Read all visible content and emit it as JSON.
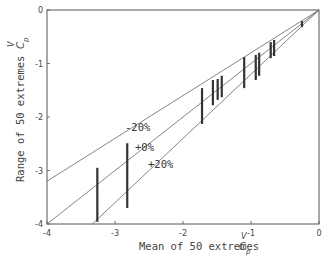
{
  "chart_data": {
    "type": "scatter",
    "title": "",
    "xlabel": "Mean of 50 extremes",
    "xlabel_symbol": {
      "main": "C",
      "sub": "p",
      "sup": "V"
    },
    "ylabel": "Range of 50 extremes",
    "ylabel_symbol": {
      "main": "C",
      "sub": "p",
      "sup": "V"
    },
    "xlim": [
      -4,
      0
    ],
    "ylim": [
      -4,
      0
    ],
    "xticks": [
      -4,
      -3,
      -2,
      -1,
      0
    ],
    "yticks": [
      0,
      -1,
      -2,
      -3,
      -4
    ],
    "xtick_labels": [
      "-4",
      "-3",
      "-2",
      "-1",
      "0"
    ],
    "ytick_labels": [
      "0",
      "-1",
      "-2",
      "-3",
      "-4"
    ],
    "grid": false,
    "legend": null,
    "reference_lines": [
      {
        "name": "-20%",
        "label": "-20%",
        "slope": 0.8,
        "through": [
          0,
          0
        ]
      },
      {
        "name": "+0%",
        "label": "+0%",
        "slope": 1.0,
        "through": [
          0,
          0
        ]
      },
      {
        "name": "+20%",
        "label": "+20%",
        "slope": 1.2,
        "through": [
          0,
          0
        ]
      }
    ],
    "series": [
      {
        "name": "Range of 50 extremes",
        "kind": "vertical-range-bars",
        "points": [
          {
            "x": -3.26,
            "y_top": -2.95,
            "y_bottom": -3.96
          },
          {
            "x": -2.82,
            "y_top": -2.49,
            "y_bottom": -3.7
          },
          {
            "x": -1.72,
            "y_top": -1.46,
            "y_bottom": -2.13
          },
          {
            "x": -1.56,
            "y_top": -1.31,
            "y_bottom": -1.78
          },
          {
            "x": -1.49,
            "y_top": -1.29,
            "y_bottom": -1.68
          },
          {
            "x": -1.43,
            "y_top": -1.23,
            "y_bottom": -1.63
          },
          {
            "x": -1.1,
            "y_top": -0.88,
            "y_bottom": -1.46
          },
          {
            "x": -0.93,
            "y_top": -0.84,
            "y_bottom": -1.31
          },
          {
            "x": -0.88,
            "y_top": -0.8,
            "y_bottom": -1.23
          },
          {
            "x": -0.71,
            "y_top": -0.6,
            "y_bottom": -0.9
          },
          {
            "x": -0.66,
            "y_top": -0.56,
            "y_bottom": -0.86
          },
          {
            "x": -0.25,
            "y_top": -0.21,
            "y_bottom": -0.32
          }
        ]
      }
    ],
    "colors": {
      "axis": "#555555",
      "lines": "#666666",
      "bars": "#333333"
    }
  }
}
